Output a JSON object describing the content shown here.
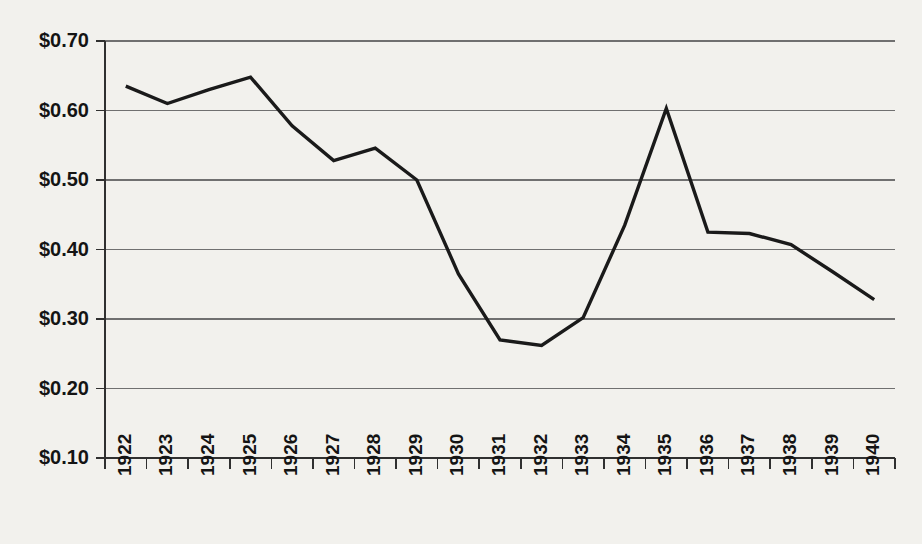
{
  "chart_data": {
    "type": "line",
    "title": "",
    "subtitle": "",
    "xlabel": "",
    "ylabel": "",
    "categories": [
      "1922",
      "1923",
      "1924",
      "1925",
      "1926",
      "1927",
      "1928",
      "1929",
      "1930",
      "1931",
      "1932",
      "1933",
      "1934",
      "1935",
      "1936",
      "1937",
      "1938",
      "1939",
      "1940"
    ],
    "values": [
      0.635,
      0.61,
      0.63,
      0.648,
      0.578,
      0.528,
      0.546,
      0.5,
      0.365,
      0.27,
      0.262,
      0.302,
      0.435,
      0.603,
      0.425,
      0.423,
      0.407,
      0.368,
      0.328
    ],
    "series": [
      {
        "name": "Price",
        "values": [
          0.635,
          0.61,
          0.63,
          0.648,
          0.578,
          0.528,
          0.546,
          0.5,
          0.365,
          0.27,
          0.262,
          0.302,
          0.435,
          0.603,
          0.425,
          0.423,
          0.407,
          0.368,
          0.328
        ]
      }
    ],
    "ylim": [
      0.1,
      0.7
    ],
    "ytick_values": [
      0.1,
      0.2,
      0.3,
      0.4,
      0.5,
      0.6,
      0.7
    ],
    "ytick_labels": [
      "$0.10",
      "$0.20",
      "$0.30",
      "$0.40",
      "$0.50",
      "$0.60",
      "$0.70"
    ],
    "xtick_labels": [
      "1922",
      "1923",
      "1924",
      "1925",
      "1926",
      "1927",
      "1928",
      "1929",
      "1930",
      "1931",
      "1932",
      "1933",
      "1934",
      "1935",
      "1936",
      "1937",
      "1938",
      "1939",
      "1940"
    ],
    "grid": true,
    "grid_axis": "y",
    "legend": false,
    "legend_position": "none",
    "annotations": [],
    "colors": {
      "background": "#f2f1ed",
      "series_line": "#1a1a1a",
      "gridline": "#707070",
      "axis": "#303030",
      "text": "#141414"
    },
    "xtick_rotation": -90
  }
}
